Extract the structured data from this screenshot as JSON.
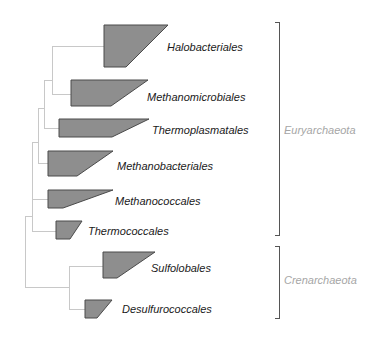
{
  "diagram": {
    "type": "phylogenetic-tree",
    "colors": {
      "branch": "#c8c8c8",
      "clade_fill": "#8e8e8e",
      "clade_stroke": "#4a4a4a",
      "taxon_text": "#1a1a1a",
      "group_text": "#a6a6a6",
      "bracket": "#555555"
    },
    "taxa": [
      {
        "label": "Halobacteriales",
        "polygon": "104,25 168,25 126,67 104,67",
        "label_x": 167,
        "label_y": 51,
        "attach_y": 46
      },
      {
        "label": "Methanomicrobiales",
        "polygon": "71,80 148,80 111,106 71,106",
        "label_x": 147,
        "label_y": 101,
        "attach_y": 94
      },
      {
        "label": "Thermoplasmatales",
        "polygon": "59,119 149,119 112,137 59,137",
        "label_x": 152,
        "label_y": 134,
        "attach_y": 128
      },
      {
        "label": "Methanobacteriales",
        "polygon": "48,151 113,151 77,176 48,176",
        "label_x": 117,
        "label_y": 170,
        "attach_y": 163
      },
      {
        "label": "Methanococcales",
        "polygon": "48,190 113,190 63,208 48,208",
        "label_x": 115,
        "label_y": 205,
        "attach_y": 199
      },
      {
        "label": "Thermococcales",
        "polygon": "56,221 82,221 70,239 56,239",
        "label_x": 88,
        "label_y": 235,
        "attach_y": 231
      },
      {
        "label": "Sulfolobales",
        "polygon": "103,252 155,252 117,278 103,278",
        "label_x": 151,
        "label_y": 272,
        "attach_y": 266
      },
      {
        "label": "Desulfurococcales",
        "polygon": "85,300 112,300 97,318 85,318",
        "label_x": 122,
        "label_y": 313,
        "attach_y": 309
      }
    ],
    "groups": [
      {
        "label": "Euryarchaeota",
        "bracket_x": 279,
        "y_top": 22,
        "y_bottom": 235,
        "label_x": 284,
        "label_y": 134
      },
      {
        "label": "Crenarchaeota",
        "bracket_x": 279,
        "y_top": 246,
        "y_bottom": 318,
        "label_x": 284,
        "label_y": 284
      }
    ],
    "branches": [
      "M52,46 H104",
      "M52,46 V94 H71",
      "M44,80 H52",
      "M44,80 V128 H59",
      "M38,108 H44",
      "M38,108 V163 H48",
      "M32,142 H38",
      "M32,142 V199 H48",
      "M32,199 V231 H56",
      "M25,216 H32",
      "M25,216 V287 H69",
      "M69,266 H103",
      "M69,266 V309 H85"
    ]
  }
}
